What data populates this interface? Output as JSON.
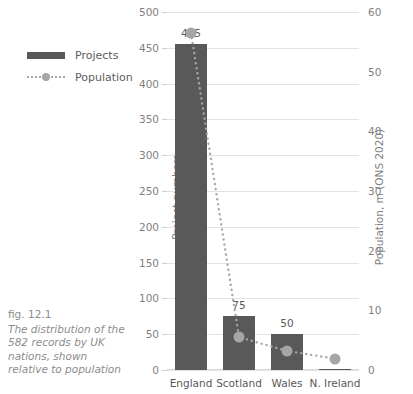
{
  "caption": {
    "figure_number": "fig. 12.1",
    "text": "The distribution of the 582 records by UK nations, shown relative to population"
  },
  "legend": {
    "items": [
      {
        "label": "Projects",
        "marker": "bar-swatch",
        "color": "#595959"
      },
      {
        "label": "Population",
        "marker": "dotted-line-with-dot",
        "color": "#a6a6a6"
      }
    ]
  },
  "chart_data": {
    "type": "bar",
    "title": "",
    "categories": [
      "England",
      "Scotland",
      "Wales",
      "N. Ireland"
    ],
    "series": [
      {
        "name": "Projects",
        "type": "bar",
        "axis": "left",
        "color": "#595959",
        "values": [
          455,
          75,
          50,
          2
        ],
        "data_labels": [
          "455",
          "75",
          "50",
          ""
        ]
      },
      {
        "name": "Population",
        "type": "line",
        "axis": "right",
        "color": "#a6a6a6",
        "line_style": "dotted",
        "values": [
          56.5,
          5.5,
          3.2,
          1.9
        ]
      }
    ],
    "xlabel": "",
    "ylabel": "Project numbers",
    "ylabel_right": "Population, m (ONS 2020)",
    "ylim": [
      0,
      500
    ],
    "ylim_right": [
      0,
      60
    ],
    "yticks": [
      0,
      50,
      100,
      150,
      200,
      250,
      300,
      350,
      400,
      450,
      500
    ],
    "yticks_right": [
      0,
      10,
      20,
      30,
      40,
      50,
      60
    ],
    "grid": true,
    "legend_position": "upper-left-outside"
  }
}
